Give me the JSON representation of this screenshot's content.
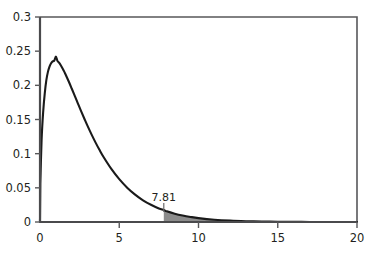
{
  "chart_data": {
    "type": "line",
    "title": "",
    "subtitle": "",
    "xlabel": "",
    "ylabel": "",
    "xlim": [
      0,
      20
    ],
    "ylim": [
      0,
      0.3
    ],
    "grid": false,
    "legend": null,
    "x_ticks": [
      0,
      5,
      10,
      15,
      20
    ],
    "x_tick_labels": [
      "0",
      "5",
      "10",
      "15",
      "20"
    ],
    "y_ticks": [
      0,
      0.05,
      0.1,
      0.15,
      0.2,
      0.25,
      0.3
    ],
    "y_tick_labels": [
      "0",
      "0.05",
      "0.1",
      "0.15",
      "0.2",
      "0.25",
      "0.3"
    ],
    "series": [
      {
        "name": "chi-square density (df=3)",
        "x": [
          0.02,
          0.1,
          0.2,
          0.3,
          0.4,
          0.5,
          0.6,
          0.7,
          0.8,
          0.9,
          1.0,
          1.1,
          1.2,
          1.3,
          1.4,
          1.5,
          1.6,
          1.8,
          2.0,
          2.2,
          2.4,
          2.6,
          2.8,
          3.0,
          3.25,
          3.5,
          3.75,
          4.0,
          4.5,
          5.0,
          5.5,
          6.0,
          6.5,
          7.0,
          7.5,
          7.81,
          8.0,
          8.5,
          9.0,
          9.5,
          10.0,
          11.0,
          12.0,
          13.0,
          14.0,
          15.0,
          16.0,
          17.0,
          18.0,
          19.0,
          20.0
        ],
        "y": [
          0.0561,
          0.12,
          0.1612,
          0.1883,
          0.2076,
          0.2197,
          0.2275,
          0.2324,
          0.2351,
          0.2362,
          0.242,
          0.2358,
          0.2331,
          0.2297,
          0.2257,
          0.2214,
          0.2166,
          0.2063,
          0.1954,
          0.1842,
          0.173,
          0.1619,
          0.1511,
          0.1406,
          0.1282,
          0.1165,
          0.1056,
          0.0955,
          0.0777,
          0.0627,
          0.0503,
          0.0401,
          0.0318,
          0.0252,
          0.0198,
          0.0176,
          0.0156,
          0.0122,
          0.0095,
          0.0074,
          0.0057,
          0.0034,
          0.002,
          0.0012,
          0.0007,
          0.0004,
          0.0002,
          0.0001,
          0.0001,
          0.0,
          0.0
        ]
      }
    ],
    "annotations": [
      {
        "label": "7.81",
        "x": 7.81,
        "kind": "critical-value-marker"
      }
    ],
    "shaded_region": {
      "from": 7.81,
      "to": 20,
      "color": "#8c8c8c",
      "description": "right tail area under curve beyond 7.81"
    },
    "colors": {
      "curve": "#1a1a1a",
      "axis": "#58585a",
      "shading": "#8c8c8c",
      "text": "#231f20",
      "background": "#ffffff"
    }
  }
}
